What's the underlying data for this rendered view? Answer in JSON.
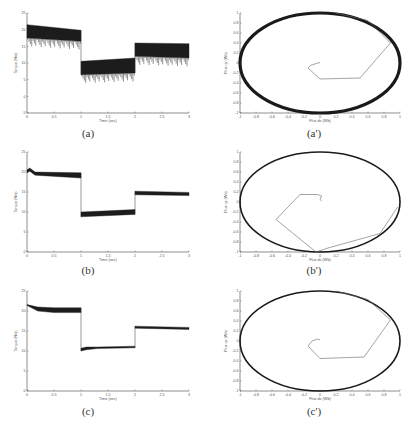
{
  "chart_data": [
    {
      "id": "a",
      "caption": "(a)",
      "type": "line",
      "title": "",
      "xlabel": "Time (sec)",
      "ylabel": "Torque (Nm)",
      "xlim": [
        0,
        3
      ],
      "ylim": [
        -5,
        25
      ],
      "xticks": [
        "0",
        "0.5",
        "1",
        "1.5",
        "2",
        "2.5",
        "3"
      ],
      "yticks": [
        "-5",
        "0",
        "5",
        "10",
        "15",
        "20",
        "25"
      ],
      "grid": false,
      "series": [
        {
          "name": "Torque",
          "band": true,
          "segments": [
            {
              "x": [
                0,
                1
              ],
              "upper": [
                21.5,
                19.8
              ],
              "lower": [
                17.5,
                16.5
              ]
            },
            {
              "x": [
                1,
                2
              ],
              "upper": [
                10.5,
                11.5
              ],
              "lower": [
                6.5,
                7.0
              ]
            },
            {
              "x": [
                2,
                3
              ],
              "upper": [
                16.0,
                15.8
              ],
              "lower": [
                12.0,
                11.5
              ]
            }
          ]
        }
      ]
    },
    {
      "id": "a_prime",
      "caption": "(a')",
      "type": "line",
      "title": "",
      "xlabel": "Flux ds (Wb)",
      "ylabel": "Flux qs (Wb)",
      "xlim": [
        -1,
        1
      ],
      "ylim": [
        -1,
        1
      ],
      "xticks": [
        "-1",
        "-0.8",
        "-0.6",
        "-0.4",
        "-0.2",
        "0",
        "0.2",
        "0.4",
        "0.6",
        "0.8",
        "1"
      ],
      "yticks": [
        "-1",
        "-0.8",
        "-0.6",
        "-0.4",
        "-0.2",
        "0",
        "0.2",
        "0.4",
        "0.6",
        "0.8",
        "1"
      ],
      "grid": false,
      "series": [
        {
          "name": "Flux circle",
          "radius": 1,
          "thickness": 3.2
        },
        {
          "name": "Flux transient",
          "x": [
            0,
            -0.03,
            -0.12,
            -0.15,
            0.0,
            0.5,
            0.88,
            0.6,
            0.2
          ],
          "y": [
            0.01,
            0.0,
            -0.05,
            -0.1,
            -0.32,
            -0.3,
            0.4,
            0.85,
            1.0
          ]
        }
      ]
    },
    {
      "id": "b",
      "caption": "(b)",
      "type": "line",
      "title": "",
      "xlabel": "Time (sec)",
      "ylabel": "Torque (Nm)",
      "xlim": [
        0,
        3
      ],
      "ylim": [
        0,
        25
      ],
      "xticks": [
        "0",
        "0.5",
        "1",
        "1.5",
        "2",
        "2.5",
        "3"
      ],
      "yticks": [
        "0",
        "5",
        "10",
        "15",
        "20",
        "25"
      ],
      "grid": false,
      "series": [
        {
          "name": "Torque",
          "band": true,
          "segments": [
            {
              "x": [
                0,
                0.05,
                0.15,
                1
              ],
              "upper": [
                20.5,
                21.0,
                20.0,
                19.8
              ],
              "lower": [
                19.8,
                20.2,
                19.2,
                18.5
              ]
            },
            {
              "x": [
                1,
                2
              ],
              "upper": [
                10.0,
                10.6
              ],
              "lower": [
                8.8,
                9.4
              ]
            },
            {
              "x": [
                2,
                3
              ],
              "upper": [
                15.2,
                14.9
              ],
              "lower": [
                14.3,
                14.1
              ]
            }
          ]
        }
      ]
    },
    {
      "id": "b_prime",
      "caption": "(b')",
      "type": "line",
      "title": "",
      "xlabel": "Flux ds (Wb)",
      "ylabel": "Flux qs (Wb)",
      "xlim": [
        -1,
        1
      ],
      "ylim": [
        -1,
        1
      ],
      "xticks": [
        "-1",
        "-0.8",
        "-0.6",
        "-0.4",
        "-0.2",
        "0",
        "0.2",
        "0.4",
        "0.6",
        "0.8",
        "1"
      ],
      "yticks": [
        "-1",
        "-0.8",
        "-0.6",
        "-0.4",
        "-0.2",
        "0",
        "0.2",
        "0.4",
        "0.6",
        "0.8",
        "1"
      ],
      "grid": false,
      "series": [
        {
          "name": "Flux circle",
          "radius": 1,
          "thickness": 1.6
        },
        {
          "name": "Flux transient",
          "x": [
            0.02,
            0.0,
            0.02,
            -0.03,
            -0.25,
            -0.55,
            -0.05,
            0.1,
            0.75,
            0.97
          ],
          "y": [
            0.02,
            0.05,
            0.12,
            0.15,
            0.15,
            -0.35,
            -1.0,
            -0.92,
            -0.63,
            -0.1
          ]
        }
      ]
    },
    {
      "id": "c",
      "caption": "(c)",
      "type": "line",
      "title": "",
      "xlabel": "Time (sec)",
      "ylabel": "Torque (Nm)",
      "xlim": [
        0,
        3
      ],
      "ylim": [
        0,
        25
      ],
      "xticks": [
        "0",
        "0.5",
        "1",
        "1.5",
        "2",
        "2.5",
        "3"
      ],
      "yticks": [
        "0",
        "5",
        "10",
        "15",
        "20",
        "25"
      ],
      "grid": false,
      "series": [
        {
          "name": "Torque",
          "band": true,
          "segments": [
            {
              "x": [
                0,
                0.2,
                0.5,
                1
              ],
              "upper": [
                21.6,
                21.0,
                20.8,
                20.8
              ],
              "lower": [
                21.4,
                20.0,
                19.6,
                19.6
              ]
            },
            {
              "x": [
                1,
                1.1,
                1.3,
                2
              ],
              "upper": [
                10.7,
                11.0,
                11.0,
                11.2
              ],
              "lower": [
                10.0,
                10.3,
                10.6,
                10.8
              ]
            },
            {
              "x": [
                2,
                3
              ],
              "upper": [
                16.2,
                15.9
              ],
              "lower": [
                15.7,
                15.4
              ]
            }
          ]
        }
      ]
    },
    {
      "id": "c_prime",
      "caption": "(c')",
      "type": "line",
      "title": "",
      "xlabel": "Flux ds (Wb)",
      "ylabel": "Flux qs (Wb)",
      "xlim": [
        -1,
        1
      ],
      "ylim": [
        -1,
        1
      ],
      "xticks": [
        "-1",
        "-0.8",
        "-0.6",
        "-0.4",
        "-0.2",
        "0",
        "0.2",
        "0.4",
        "0.6",
        "0.8",
        "1"
      ],
      "yticks": [
        "-1",
        "-0.8",
        "-0.6",
        "-0.4",
        "-0.2",
        "0",
        "0.2",
        "0.4",
        "0.6",
        "0.8",
        "1"
      ],
      "grid": false,
      "series": [
        {
          "name": "Flux circle",
          "radius": 1,
          "thickness": 1.6
        },
        {
          "name": "Flux transient",
          "x": [
            0.0,
            -0.03,
            -0.1,
            -0.15,
            0.0,
            0.55,
            0.88,
            0.6,
            0.2
          ],
          "y": [
            0.02,
            0.04,
            0.0,
            -0.1,
            -0.35,
            -0.32,
            0.42,
            0.83,
            1.0
          ]
        }
      ]
    }
  ],
  "layout": {
    "panels": [
      {
        "id": "a",
        "left": 0,
        "top": 0,
        "caption_left": 68,
        "caption_top": 127
      },
      {
        "id": "a_prime",
        "left": 206,
        "top": 0,
        "caption_left": 294,
        "caption_top": 127
      },
      {
        "id": "b",
        "left": 0,
        "top": 139,
        "caption_left": 68,
        "caption_top": 264
      },
      {
        "id": "b_prime",
        "left": 206,
        "top": 139,
        "caption_left": 294,
        "caption_top": 264
      },
      {
        "id": "c",
        "left": 0,
        "top": 278,
        "caption_left": 68,
        "caption_top": 405
      },
      {
        "id": "c_prime",
        "left": 206,
        "top": 278,
        "caption_left": 294,
        "caption_top": 405
      }
    ]
  }
}
